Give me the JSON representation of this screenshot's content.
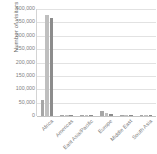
{
  "chart_data": {
    "type": "bar",
    "title": "",
    "xlabel": "",
    "ylabel": "Number of visitors",
    "ylim": [
      0,
      400000
    ],
    "ytick_values": [
      0,
      50000,
      100000,
      150000,
      200000,
      250000,
      300000,
      350000,
      400000
    ],
    "ytick_labels": [
      "0",
      "50,000",
      "100,000",
      "150,000",
      "200,000",
      "250,000",
      "300,000",
      "350,000",
      "400,000"
    ],
    "grid": true,
    "legend": "none",
    "categories": [
      "Africa",
      "Americas",
      "East Asia/Pacific",
      "Europe",
      "Middle East",
      "South Asia"
    ],
    "series": [
      {
        "name": "Series 1",
        "color": "#a6a6a6",
        "values": [
          60000,
          5000,
          2500,
          17000,
          1200,
          1000
        ]
      },
      {
        "name": "Series 2",
        "color": "#bfbfbf",
        "values": [
          378000,
          4000,
          2000,
          11000,
          1000,
          800
        ]
      },
      {
        "name": "Series 3",
        "color": "#8c8c8c",
        "values": [
          365000,
          3000,
          1500,
          9000,
          900,
          700
        ]
      }
    ]
  },
  "colors": {
    "gridline": "#e2e2e2",
    "axis": "#c4c4c4",
    "tick_text": "#808080",
    "axis_title_text": "#6b6b6b",
    "background": "#ffffff"
  }
}
